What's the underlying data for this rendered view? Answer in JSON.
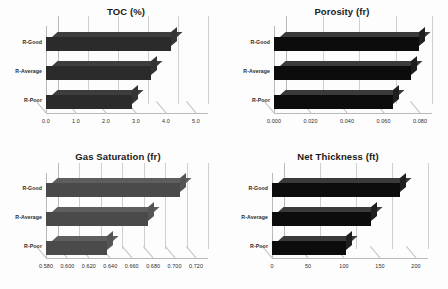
{
  "figure": {
    "panels": [
      "toc",
      "porosity",
      "gassat",
      "netthick"
    ],
    "background_color": "#fdfdfd",
    "axis_color": "#b9b9b9",
    "grid_color": "#cfcfcf"
  },
  "chart_data": [
    {
      "id": "toc",
      "type": "bar",
      "orientation": "horizontal",
      "title": "TOC (%)",
      "xlabel": "",
      "ylabel": "",
      "categories": [
        "R-Poor",
        "R-Average",
        "R-Good"
      ],
      "values": [
        2.85,
        3.5,
        4.15
      ],
      "xlim": [
        0.0,
        5.0
      ],
      "xticks": [
        0.0,
        1.0,
        2.0,
        3.0,
        4.0,
        5.0
      ],
      "xticklabels": [
        "0.0",
        "1.0",
        "2.0",
        "3.0",
        "4.0",
        "5.0"
      ],
      "grid": true,
      "legend": "none",
      "bar_color": "#2b2b2b",
      "style": "3d"
    },
    {
      "id": "porosity",
      "type": "bar",
      "orientation": "horizontal",
      "title": "Porosity (fr)",
      "xlabel": "",
      "ylabel": "",
      "categories": [
        "R-Poor",
        "R-Average",
        "R-Good"
      ],
      "values": [
        0.065,
        0.0748,
        0.0795
      ],
      "xlim": [
        0.0,
        0.08
      ],
      "xticks": [
        0.0,
        0.02,
        0.04,
        0.06,
        0.08
      ],
      "xticklabels": [
        "0.000",
        "0.020",
        "0.040",
        "0.060",
        "0.080"
      ],
      "grid": true,
      "legend": "none",
      "bar_color": "#0c0c0c",
      "style": "3d"
    },
    {
      "id": "gassat",
      "type": "bar",
      "orientation": "horizontal",
      "title": "Gas Saturation (fr)",
      "xlabel": "",
      "ylabel": "",
      "categories": [
        "R-Poor",
        "R-Average",
        "R-Good"
      ],
      "values": [
        0.637,
        0.675,
        0.705
      ],
      "xlim": [
        0.58,
        0.72
      ],
      "xticks": [
        0.58,
        0.6,
        0.62,
        0.64,
        0.66,
        0.68,
        0.7,
        0.72
      ],
      "xticklabels": [
        "0.580",
        "0.600",
        "0.620",
        "0.640",
        "0.660",
        "0.680",
        "0.700",
        "0.720"
      ],
      "grid": true,
      "legend": "none",
      "bar_color": "#4a4a4a",
      "style": "3d"
    },
    {
      "id": "netthick",
      "type": "bar",
      "orientation": "horizontal",
      "title": "Net Thickness (ft)",
      "xlabel": "",
      "ylabel": "",
      "categories": [
        "R-Poor",
        "R-Average",
        "R-Good"
      ],
      "values": [
        103,
        138,
        178
      ],
      "xlim": [
        0,
        200
      ],
      "xticks": [
        0,
        50,
        100,
        150,
        200
      ],
      "xticklabels": [
        "0",
        "50",
        "100",
        "150",
        "200"
      ],
      "grid": true,
      "legend": "none",
      "bar_color": "#0c0c0c",
      "style": "3d"
    }
  ]
}
